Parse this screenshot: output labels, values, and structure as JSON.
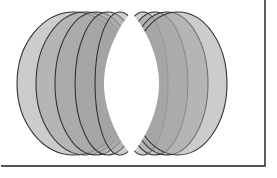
{
  "figure": {
    "canvas": {
      "width": 277,
      "height": 178
    },
    "background_color": "#ffffff",
    "frame": {
      "name": "figure-frame",
      "stroke_color": "#1a1a1a",
      "stroke_width": 1.4,
      "left": 1,
      "top": -40,
      "right": 265,
      "bottom": 166,
      "visible_edges": "right-and-bottom"
    },
    "shape_style": {
      "fill_color": "#a3a3a3",
      "fill_opacity": 0.55,
      "stroke_color": "#333333",
      "stroke_width": 1.1
    },
    "center_gap_color": "#ffffff",
    "pencil": {
      "type": "ellipse-pencil",
      "count": 9,
      "common_point_top": {
        "x": 131,
        "y": 12
      },
      "common_point_bottom": {
        "x": 131,
        "y": 155
      },
      "center_y": 83.5,
      "semi_minor_y": 71.5,
      "x_centers": [
        74,
        85,
        96,
        108,
        120,
        143,
        155,
        167,
        178
      ],
      "semi_major_x": [
        57,
        49,
        41,
        33,
        25,
        25,
        33,
        41,
        49
      ],
      "extent_left": 17,
      "extent_right": 240,
      "extent_top": 12,
      "extent_bottom": 155
    }
  }
}
